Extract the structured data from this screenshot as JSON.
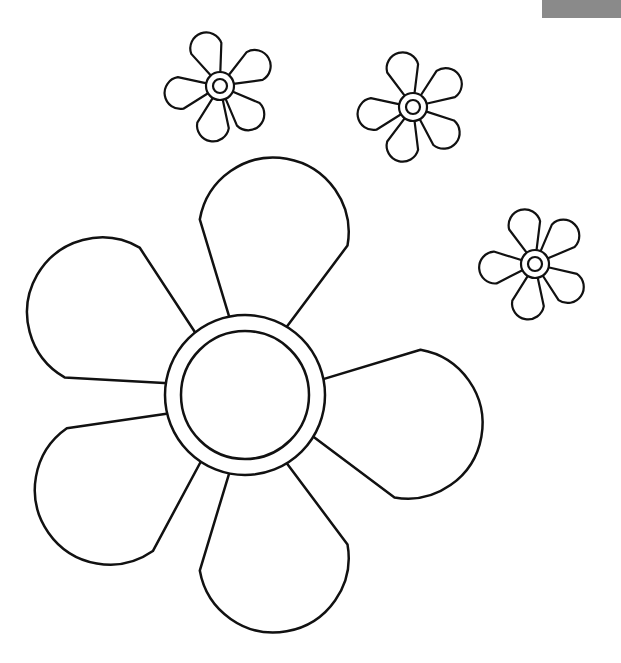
{
  "image": {
    "subject": "flower coloring page",
    "line_color": "#111111",
    "background_color": "#ffffff",
    "corner_bar_color": "#8a8a8a"
  },
  "flowers": [
    {
      "name": "large-flower",
      "petal_count": 5
    },
    {
      "name": "small-flower-top-left",
      "petal_count": 5
    },
    {
      "name": "small-flower-top-middle",
      "petal_count": 5
    },
    {
      "name": "small-flower-right",
      "petal_count": 5
    }
  ]
}
